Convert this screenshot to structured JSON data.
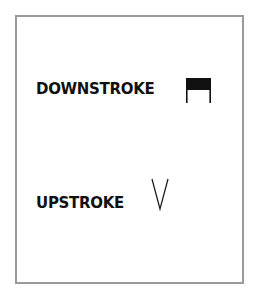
{
  "legend": {
    "items": [
      {
        "label": "DOWNSTROKE",
        "symbol": "downstroke-bow-mark"
      },
      {
        "label": "UPSTROKE",
        "symbol": "upstroke-bow-mark"
      }
    ]
  },
  "colors": {
    "frame": "#9a9a9a",
    "text": "#111111",
    "symbol": "#111111"
  }
}
